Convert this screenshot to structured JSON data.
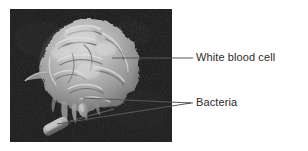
{
  "figure": {
    "type": "labeled-micrograph",
    "background_color": "#ffffff",
    "photo": {
      "alt_name": "scanning-electron-micrograph",
      "background_color": "#161616",
      "subject_color": "#b9b9b9",
      "x": 10,
      "y": 9,
      "width": 162,
      "height": 133
    },
    "labels": [
      {
        "id": "white-blood-cell",
        "text": "White blood cell",
        "color": "#2b2b2b",
        "x": 196,
        "y": 58,
        "leader": {
          "from_x": 112,
          "to_x": 193,
          "y": 58,
          "branches": 1
        }
      },
      {
        "id": "bacteria",
        "text": "Bacteria",
        "color": "#2b2b2b",
        "x": 196,
        "y": 103,
        "leader": {
          "to_x": 193,
          "y": 103,
          "branches": 2,
          "origins": [
            {
              "x": 83,
              "y": 98
            },
            {
              "x": 57,
              "y": 124
            }
          ]
        }
      }
    ],
    "leader_line_color": "#585858"
  }
}
